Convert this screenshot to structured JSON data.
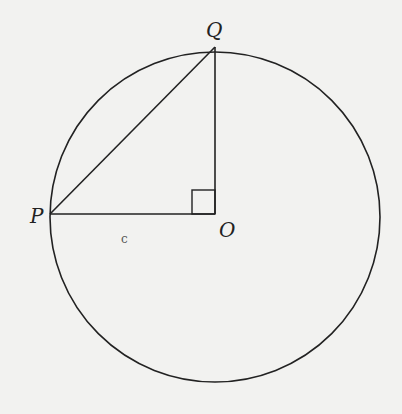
{
  "diagram": {
    "circle": {
      "cx": 215,
      "cy": 214,
      "r": 165
    },
    "points": {
      "P": {
        "label": "P",
        "x": 50,
        "y": 214
      },
      "Q": {
        "label": "Q",
        "x": 215,
        "y": 49
      },
      "O": {
        "label": "O",
        "x": 215,
        "y": 214
      }
    },
    "segments": [
      "PQ",
      "QO",
      "PO"
    ],
    "right_angle_at": "O",
    "stray_mark": "c",
    "colors": {
      "stroke": "#222222",
      "background": "#f2f2f0"
    }
  }
}
